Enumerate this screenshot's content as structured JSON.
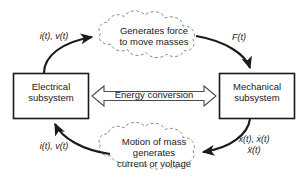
{
  "diagram": {
    "title": "Electromechanical energy conversion cycle",
    "colors": {
      "stroke": "#1a1a1a",
      "cloud_stroke": "#8c8c8c",
      "box_stroke": "#1a1a1a",
      "background": "#ffffff",
      "hollow_arrow_stroke": "#4d4d4d"
    },
    "blocks": {
      "electrical": {
        "line1": "Electrical",
        "line2": "subsystem"
      },
      "mechanical": {
        "line1": "Mechanical",
        "line2": "subsystem"
      }
    },
    "clouds": {
      "top": {
        "line1": "Generates force",
        "line2": "to move masses"
      },
      "bottom": {
        "line1": "Motion of mass",
        "line2": "generates",
        "line3": "current or voltage"
      }
    },
    "center_arrow": {
      "label": "Energy conversion",
      "style": "double-headed-hollow"
    },
    "signal_labels": {
      "top_left": "i(t), v(t)",
      "top_right": "F(t)",
      "bottom_left": "i(t), v(t)",
      "bottom_right_line1": "x(t), ẋ(t)",
      "bottom_right_line2": "ẍ(t)"
    },
    "arrows": [
      {
        "name": "electrical-to-top-cloud",
        "from": "electrical-subsystem",
        "to": "top-cloud",
        "label": "i(t), v(t)"
      },
      {
        "name": "top-cloud-to-mechanical",
        "from": "top-cloud",
        "to": "mechanical-subsystem",
        "label": "F(t)"
      },
      {
        "name": "mechanical-to-bottom-cloud",
        "from": "mechanical-subsystem",
        "to": "bottom-cloud",
        "label": "x(t), ẋ(t) ẍ(t)"
      },
      {
        "name": "bottom-cloud-to-electrical",
        "from": "bottom-cloud",
        "to": "electrical-subsystem",
        "label": "i(t), v(t)"
      }
    ]
  }
}
